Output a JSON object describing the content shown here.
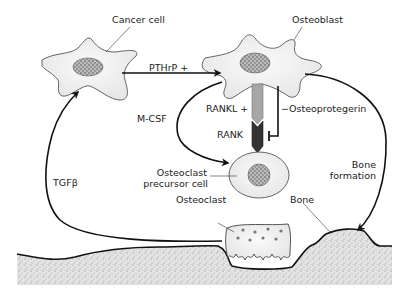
{
  "diagram": {
    "type": "biological-pathway",
    "nodes": [
      {
        "id": "cancer_cell",
        "label": "Cancer cell"
      },
      {
        "id": "osteoblast",
        "label": "Osteoblast"
      },
      {
        "id": "osteoclast_precursor",
        "label": "Osteoclast\nprecursor cell"
      },
      {
        "id": "osteoclast",
        "label": "Osteoclast"
      },
      {
        "id": "bone",
        "label": "Bone"
      }
    ],
    "edges": [
      {
        "from": "cancer_cell",
        "to": "osteoblast",
        "label": "PTHrP +",
        "type": "stimulate"
      },
      {
        "from": "osteoblast",
        "to": "osteoclast_precursor",
        "label": "M-CSF",
        "type": "stimulate"
      },
      {
        "from": "osteoblast",
        "to": "osteoclast_precursor",
        "label": "RANKL +",
        "type": "ligand-receptor"
      },
      {
        "from": "osteoblast",
        "to": "rank",
        "label": "Osteoprotegerin",
        "type": "inhibit"
      },
      {
        "from": "bone",
        "to": "cancer_cell",
        "label": "TGFβ",
        "type": "stimulate"
      },
      {
        "from": "osteoblast",
        "to": "bone",
        "label": "Bone formation",
        "type": "stimulate"
      }
    ]
  },
  "labels": {
    "cancer_cell": "Cancer cell",
    "osteoblast": "Osteoblast",
    "pthrp": "PTHrP +",
    "mcsf": "M-CSF",
    "rankl": "RANKL +",
    "rank": "RANK",
    "osteoprotegerin": "Osteoprotegerin",
    "osteoprotegerin_sign": "−",
    "precursor_line1": "Osteoclast",
    "precursor_line2": "precursor cell",
    "tgfb": "TGFβ",
    "bone_formation_line1": "Bone",
    "bone_formation_line2": "formation",
    "osteoclast": "Osteoclast",
    "bone": "Bone"
  },
  "colors": {
    "line": "#111111",
    "cell_fill": "#f2f2f2",
    "rankl_fill": "#a8a8a8",
    "rank_fill": "#333333",
    "bone_fill": "#d8d8d8"
  }
}
